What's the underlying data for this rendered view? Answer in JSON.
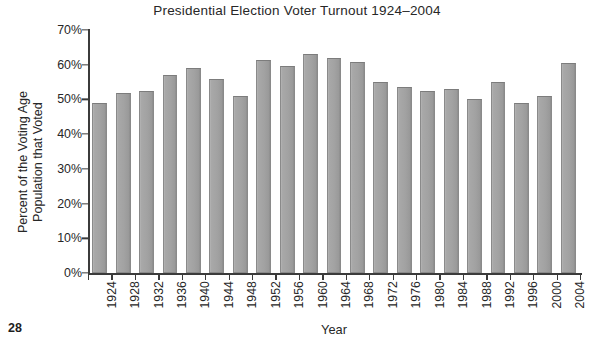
{
  "page": {
    "page_number": "28"
  },
  "chart_data": {
    "type": "bar",
    "title": "Presidential Election Voter Turnout 1924–2004",
    "xlabel": "Year",
    "ylabel_lines": [
      "Percent of the Voting Age",
      "Population that Voted"
    ],
    "ylabel": "Percent of the Voting Age Population that Voted",
    "categories": [
      "1924",
      "1928",
      "1932",
      "1936",
      "1940",
      "1944",
      "1948",
      "1952",
      "1956",
      "1960",
      "1964",
      "1968",
      "1972",
      "1976",
      "1980",
      "1984",
      "1988",
      "1992",
      "1996",
      "2000",
      "2004"
    ],
    "values": [
      49.0,
      52.0,
      52.5,
      57.0,
      59.0,
      56.0,
      51.0,
      61.5,
      59.5,
      63.0,
      62.0,
      60.8,
      55.0,
      53.5,
      52.5,
      53.0,
      50.0,
      55.0,
      49.0,
      51.0,
      60.5
    ],
    "unit": "%",
    "ylim": [
      0,
      70
    ],
    "ytick_values": [
      0,
      10,
      20,
      30,
      40,
      50,
      60,
      70
    ],
    "ytick_labels": [
      "0%",
      "10%",
      "20%",
      "30%",
      "40%",
      "50%",
      "60%",
      "70%"
    ],
    "grid": false,
    "legend": null,
    "bar_color": "#a2a2a2",
    "bar_edge_color": "#8a8a8a",
    "axis_color": "#3b3b3b",
    "text_color": "#272727"
  }
}
